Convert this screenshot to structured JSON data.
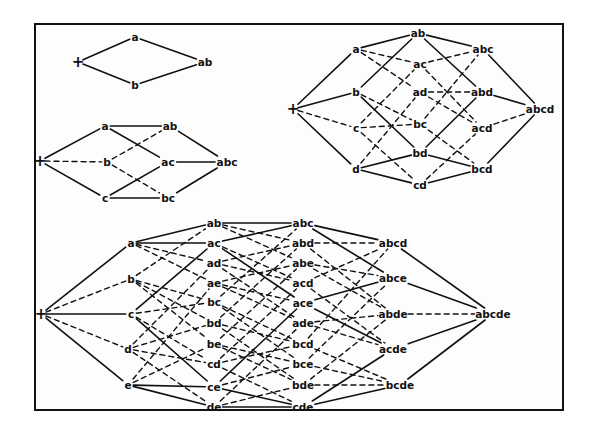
{
  "colors": {
    "line": "#111111",
    "background": "#fdfdfd"
  },
  "diagrams": [
    {
      "id": "lattice-2",
      "nodes": [
        {
          "id": "+",
          "label": "+",
          "x": 78,
          "y": 62
        },
        {
          "id": "a",
          "label": "a",
          "x": 135,
          "y": 37
        },
        {
          "id": "b",
          "label": "b",
          "x": 135,
          "y": 85
        },
        {
          "id": "ab",
          "label": "ab",
          "x": 205,
          "y": 62
        }
      ],
      "edges": [
        [
          "+",
          "a",
          "solid"
        ],
        [
          "+",
          "b",
          "solid"
        ],
        [
          "a",
          "ab",
          "solid"
        ],
        [
          "b",
          "ab",
          "solid"
        ]
      ]
    },
    {
      "id": "lattice-3",
      "nodes": [
        {
          "id": "+",
          "label": "+",
          "x": 40,
          "y": 161
        },
        {
          "id": "a",
          "label": "a",
          "x": 105,
          "y": 126
        },
        {
          "id": "b",
          "label": "b",
          "x": 107,
          "y": 162
        },
        {
          "id": "c",
          "label": "c",
          "x": 105,
          "y": 198
        },
        {
          "id": "ab",
          "label": "ab",
          "x": 170,
          "y": 126
        },
        {
          "id": "ac",
          "label": "ac",
          "x": 168,
          "y": 162
        },
        {
          "id": "bc",
          "label": "bc",
          "x": 168,
          "y": 198
        },
        {
          "id": "abc",
          "label": "abc",
          "x": 227,
          "y": 162
        }
      ],
      "edges": [
        [
          "+",
          "a",
          "solid"
        ],
        [
          "+",
          "b",
          "dashed"
        ],
        [
          "+",
          "c",
          "solid"
        ],
        [
          "a",
          "ab",
          "solid"
        ],
        [
          "a",
          "ac",
          "solid"
        ],
        [
          "b",
          "ab",
          "dashed"
        ],
        [
          "b",
          "bc",
          "dashed"
        ],
        [
          "c",
          "ac",
          "solid"
        ],
        [
          "c",
          "bc",
          "solid"
        ],
        [
          "ab",
          "abc",
          "solid"
        ],
        [
          "ac",
          "abc",
          "solid"
        ],
        [
          "bc",
          "abc",
          "solid"
        ]
      ]
    },
    {
      "id": "lattice-4",
      "nodes": [
        {
          "id": "+",
          "label": "+",
          "x": 293,
          "y": 109
        },
        {
          "id": "a",
          "label": "a",
          "x": 356,
          "y": 49
        },
        {
          "id": "b",
          "label": "b",
          "x": 356,
          "y": 92
        },
        {
          "id": "c",
          "label": "c",
          "x": 356,
          "y": 128
        },
        {
          "id": "d",
          "label": "d",
          "x": 356,
          "y": 169
        },
        {
          "id": "ab",
          "label": "ab",
          "x": 418,
          "y": 33
        },
        {
          "id": "ac",
          "label": "ac",
          "x": 420,
          "y": 64
        },
        {
          "id": "ad",
          "label": "ad",
          "x": 420,
          "y": 92
        },
        {
          "id": "bc",
          "label": "bc",
          "x": 420,
          "y": 124
        },
        {
          "id": "bd",
          "label": "bd",
          "x": 420,
          "y": 153
        },
        {
          "id": "cd",
          "label": "cd",
          "x": 420,
          "y": 185
        },
        {
          "id": "abc",
          "label": "abc",
          "x": 483,
          "y": 49
        },
        {
          "id": "abd",
          "label": "abd",
          "x": 482,
          "y": 92
        },
        {
          "id": "acd",
          "label": "acd",
          "x": 482,
          "y": 128
        },
        {
          "id": "bcd",
          "label": "bcd",
          "x": 482,
          "y": 169
        },
        {
          "id": "abcd",
          "label": "abcd",
          "x": 540,
          "y": 109
        }
      ],
      "edges": [
        [
          "+",
          "a",
          "solid"
        ],
        [
          "+",
          "b",
          "solid"
        ],
        [
          "+",
          "c",
          "dashed"
        ],
        [
          "+",
          "d",
          "solid"
        ],
        [
          "a",
          "ab",
          "solid"
        ],
        [
          "a",
          "ac",
          "dashed"
        ],
        [
          "a",
          "ad",
          "dashed"
        ],
        [
          "b",
          "ab",
          "solid"
        ],
        [
          "b",
          "bc",
          "dashed"
        ],
        [
          "b",
          "bd",
          "solid"
        ],
        [
          "c",
          "ac",
          "dashed"
        ],
        [
          "c",
          "bc",
          "dashed"
        ],
        [
          "c",
          "cd",
          "dashed"
        ],
        [
          "d",
          "ad",
          "dashed"
        ],
        [
          "d",
          "bd",
          "solid"
        ],
        [
          "d",
          "cd",
          "solid"
        ],
        [
          "ab",
          "abc",
          "solid"
        ],
        [
          "ab",
          "abd",
          "solid"
        ],
        [
          "ac",
          "abc",
          "dashed"
        ],
        [
          "ac",
          "acd",
          "dashed"
        ],
        [
          "ad",
          "abd",
          "dashed"
        ],
        [
          "ad",
          "acd",
          "dashed"
        ],
        [
          "bc",
          "abc",
          "dashed"
        ],
        [
          "bc",
          "bcd",
          "dashed"
        ],
        [
          "bd",
          "abd",
          "solid"
        ],
        [
          "bd",
          "bcd",
          "solid"
        ],
        [
          "cd",
          "acd",
          "dashed"
        ],
        [
          "cd",
          "bcd",
          "solid"
        ],
        [
          "abc",
          "abcd",
          "solid"
        ],
        [
          "abd",
          "abcd",
          "solid"
        ],
        [
          "acd",
          "abcd",
          "dashed"
        ],
        [
          "bcd",
          "abcd",
          "solid"
        ]
      ]
    },
    {
      "id": "lattice-5",
      "nodes": [
        {
          "id": "+",
          "label": "+",
          "x": 41,
          "y": 314
        },
        {
          "id": "a",
          "label": "a",
          "x": 131,
          "y": 243
        },
        {
          "id": "b",
          "label": "b",
          "x": 131,
          "y": 279
        },
        {
          "id": "c",
          "label": "c",
          "x": 131,
          "y": 314
        },
        {
          "id": "d",
          "label": "d",
          "x": 128,
          "y": 349
        },
        {
          "id": "e",
          "label": "e",
          "x": 128,
          "y": 385
        },
        {
          "id": "ab",
          "label": "ab",
          "x": 214,
          "y": 223
        },
        {
          "id": "ac",
          "label": "ac",
          "x": 214,
          "y": 243
        },
        {
          "id": "ad",
          "label": "ad",
          "x": 214,
          "y": 263
        },
        {
          "id": "ae",
          "label": "ae",
          "x": 214,
          "y": 283
        },
        {
          "id": "bc",
          "label": "bc",
          "x": 214,
          "y": 302
        },
        {
          "id": "bd",
          "label": "bd",
          "x": 214,
          "y": 323
        },
        {
          "id": "be",
          "label": "be",
          "x": 214,
          "y": 344
        },
        {
          "id": "cd",
          "label": "cd",
          "x": 214,
          "y": 364
        },
        {
          "id": "ce",
          "label": "ce",
          "x": 214,
          "y": 387
        },
        {
          "id": "de",
          "label": "de",
          "x": 214,
          "y": 407
        },
        {
          "id": "abc",
          "label": "abc",
          "x": 303,
          "y": 223
        },
        {
          "id": "abd",
          "label": "abd",
          "x": 303,
          "y": 243
        },
        {
          "id": "abe",
          "label": "abe",
          "x": 303,
          "y": 263
        },
        {
          "id": "acd",
          "label": "acd",
          "x": 303,
          "y": 283
        },
        {
          "id": "ace",
          "label": "ace",
          "x": 303,
          "y": 303
        },
        {
          "id": "ade",
          "label": "ade",
          "x": 303,
          "y": 323
        },
        {
          "id": "bcd",
          "label": "bcd",
          "x": 303,
          "y": 344
        },
        {
          "id": "bce",
          "label": "bce",
          "x": 303,
          "y": 364
        },
        {
          "id": "bde",
          "label": "bde",
          "x": 303,
          "y": 385
        },
        {
          "id": "cde",
          "label": "cde",
          "x": 303,
          "y": 407
        },
        {
          "id": "abcd",
          "label": "abcd",
          "x": 393,
          "y": 243
        },
        {
          "id": "abce",
          "label": "abce",
          "x": 393,
          "y": 278
        },
        {
          "id": "abde",
          "label": "abde",
          "x": 393,
          "y": 314
        },
        {
          "id": "acde",
          "label": "acde",
          "x": 393,
          "y": 349
        },
        {
          "id": "bcde",
          "label": "bcde",
          "x": 400,
          "y": 385
        },
        {
          "id": "abcde",
          "label": "abcde",
          "x": 493,
          "y": 314
        }
      ],
      "edges": [
        [
          "+",
          "a",
          "solid"
        ],
        [
          "+",
          "b",
          "dashed"
        ],
        [
          "+",
          "c",
          "solid"
        ],
        [
          "+",
          "d",
          "dashed"
        ],
        [
          "+",
          "e",
          "solid"
        ],
        [
          "a",
          "ab",
          "solid"
        ],
        [
          "a",
          "ac",
          "solid"
        ],
        [
          "a",
          "ad",
          "dashed"
        ],
        [
          "a",
          "ae",
          "dashed"
        ],
        [
          "b",
          "ab",
          "dashed"
        ],
        [
          "b",
          "bc",
          "dashed"
        ],
        [
          "b",
          "bd",
          "dashed"
        ],
        [
          "b",
          "be",
          "dashed"
        ],
        [
          "c",
          "ac",
          "solid"
        ],
        [
          "c",
          "bc",
          "dashed"
        ],
        [
          "c",
          "cd",
          "dashed"
        ],
        [
          "c",
          "ce",
          "solid"
        ],
        [
          "d",
          "ad",
          "dashed"
        ],
        [
          "d",
          "bd",
          "dashed"
        ],
        [
          "d",
          "cd",
          "dashed"
        ],
        [
          "d",
          "de",
          "dashed"
        ],
        [
          "e",
          "ae",
          "dashed"
        ],
        [
          "e",
          "be",
          "dashed"
        ],
        [
          "e",
          "ce",
          "solid"
        ],
        [
          "e",
          "de",
          "solid"
        ],
        [
          "ab",
          "abc",
          "solid"
        ],
        [
          "ab",
          "abd",
          "dashed"
        ],
        [
          "ab",
          "abe",
          "dashed"
        ],
        [
          "ac",
          "abc",
          "solid"
        ],
        [
          "ac",
          "acd",
          "dashed"
        ],
        [
          "ac",
          "ace",
          "solid"
        ],
        [
          "ad",
          "abd",
          "dashed"
        ],
        [
          "ad",
          "acd",
          "dashed"
        ],
        [
          "ad",
          "ade",
          "dashed"
        ],
        [
          "ae",
          "abe",
          "dashed"
        ],
        [
          "ae",
          "ace",
          "dashed"
        ],
        [
          "ae",
          "ade",
          "dashed"
        ],
        [
          "bc",
          "abc",
          "dashed"
        ],
        [
          "bc",
          "bcd",
          "dashed"
        ],
        [
          "bc",
          "bce",
          "dashed"
        ],
        [
          "bd",
          "abd",
          "dashed"
        ],
        [
          "bd",
          "bcd",
          "dashed"
        ],
        [
          "bd",
          "bde",
          "dashed"
        ],
        [
          "be",
          "abe",
          "dashed"
        ],
        [
          "be",
          "bce",
          "dashed"
        ],
        [
          "be",
          "bde",
          "dashed"
        ],
        [
          "cd",
          "acd",
          "dashed"
        ],
        [
          "cd",
          "bcd",
          "dashed"
        ],
        [
          "cd",
          "cde",
          "dashed"
        ],
        [
          "ce",
          "ace",
          "solid"
        ],
        [
          "ce",
          "bce",
          "dashed"
        ],
        [
          "ce",
          "cde",
          "solid"
        ],
        [
          "de",
          "ade",
          "dashed"
        ],
        [
          "de",
          "bde",
          "dashed"
        ],
        [
          "de",
          "cde",
          "solid"
        ],
        [
          "abc",
          "abcd",
          "solid"
        ],
        [
          "abc",
          "abce",
          "solid"
        ],
        [
          "abd",
          "abcd",
          "dashed"
        ],
        [
          "abd",
          "abde",
          "dashed"
        ],
        [
          "abe",
          "abce",
          "dashed"
        ],
        [
          "abe",
          "abde",
          "dashed"
        ],
        [
          "acd",
          "abcd",
          "dashed"
        ],
        [
          "acd",
          "acde",
          "dashed"
        ],
        [
          "ace",
          "abce",
          "solid"
        ],
        [
          "ace",
          "acde",
          "solid"
        ],
        [
          "ade",
          "abde",
          "dashed"
        ],
        [
          "ade",
          "acde",
          "dashed"
        ],
        [
          "bcd",
          "abcd",
          "dashed"
        ],
        [
          "bcd",
          "bcde",
          "dashed"
        ],
        [
          "bce",
          "abce",
          "dashed"
        ],
        [
          "bce",
          "bcde",
          "dashed"
        ],
        [
          "bde",
          "abde",
          "dashed"
        ],
        [
          "bde",
          "bcde",
          "dashed"
        ],
        [
          "cde",
          "acde",
          "solid"
        ],
        [
          "cde",
          "bcde",
          "solid"
        ],
        [
          "abcd",
          "abcde",
          "solid"
        ],
        [
          "abce",
          "abcde",
          "solid"
        ],
        [
          "abde",
          "abcde",
          "dashed"
        ],
        [
          "acde",
          "abcde",
          "solid"
        ],
        [
          "bcde",
          "abcde",
          "solid"
        ]
      ]
    }
  ]
}
